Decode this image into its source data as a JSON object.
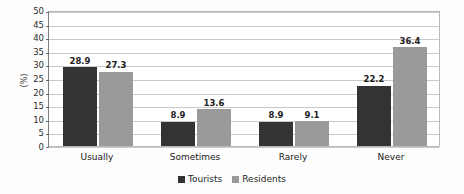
{
  "chart_data": {
    "type": "bar",
    "title": "",
    "xlabel": "",
    "ylabel": "(%)",
    "ylim": [
      0,
      50
    ],
    "ytick_step": 5,
    "yticks": [
      50,
      45,
      40,
      35,
      30,
      25,
      20,
      15,
      10,
      5,
      0
    ],
    "grid": true,
    "legend_position": "bottom-center",
    "categories": [
      "Usually",
      "Sometimes",
      "Rarely",
      "Never"
    ],
    "series": [
      {
        "name": "Tourists",
        "color": "#333333",
        "values": [
          28.9,
          8.9,
          8.9,
          22.2
        ],
        "labels": [
          "28.9",
          "8.9",
          "8.9",
          "22.2"
        ]
      },
      {
        "name": "Residents",
        "color": "#9a9a9a",
        "values": [
          27.3,
          13.6,
          9.1,
          36.4
        ],
        "labels": [
          "27.3",
          "13.6",
          "9.1",
          "36.4"
        ]
      }
    ]
  }
}
